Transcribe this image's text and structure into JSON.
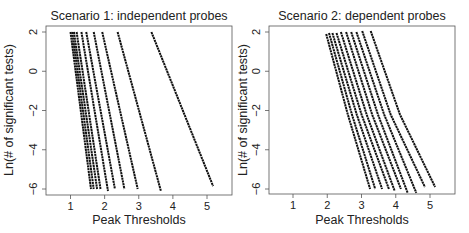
{
  "chart_data": [
    {
      "type": "line",
      "title": "Scenario 1: independent probes",
      "xlabel": "Peak Thresholds",
      "ylabel": "Ln(# of significant tests)",
      "xlim": [
        0.35,
        5.7
      ],
      "ylim": [
        -6.35,
        2.3
      ],
      "xticks": [
        1,
        2,
        3,
        4,
        5
      ],
      "yticks": [
        2,
        0,
        -2,
        -4,
        -6
      ],
      "grid": false,
      "legend": null,
      "series": [
        {
          "name": "curve-1",
          "x": [
            1.0,
            1.6
          ],
          "y": [
            2,
            -6
          ]
        },
        {
          "name": "curve-2",
          "x": [
            1.05,
            1.68
          ],
          "y": [
            2,
            -6
          ]
        },
        {
          "name": "curve-3",
          "x": [
            1.1,
            1.78
          ],
          "y": [
            2,
            -6
          ]
        },
        {
          "name": "curve-4",
          "x": [
            1.18,
            1.88
          ],
          "y": [
            2,
            -6
          ]
        },
        {
          "name": "curve-5",
          "x": [
            1.32,
            2.1
          ],
          "y": [
            2,
            -6.1
          ]
        },
        {
          "name": "curve-6",
          "x": [
            1.46,
            2.3
          ],
          "y": [
            2,
            -6
          ]
        },
        {
          "name": "curve-7",
          "x": [
            1.68,
            2.58
          ],
          "y": [
            2,
            -6
          ]
        },
        {
          "name": "curve-8",
          "x": [
            1.93,
            2.97
          ],
          "y": [
            2,
            -6
          ]
        },
        {
          "name": "curve-9",
          "x": [
            2.38,
            3.65
          ],
          "y": [
            2,
            -6.1
          ]
        },
        {
          "name": "curve-10",
          "x": [
            3.37,
            5.18
          ],
          "y": [
            2,
            -5.85
          ]
        }
      ]
    },
    {
      "type": "line",
      "title": "Scenario 2: dependent probes",
      "xlabel": "Peak Thresholds",
      "ylabel": "Ln(# of significant tests)",
      "xlim": [
        0.35,
        5.7
      ],
      "ylim": [
        -6.35,
        2.3
      ],
      "xticks": [
        1,
        2,
        3,
        4,
        5
      ],
      "yticks": [
        2,
        0,
        -2,
        -4,
        -6
      ],
      "grid": false,
      "legend": null,
      "series": [
        {
          "name": "curve-1",
          "x": [
            1.97,
            2.6,
            3.25
          ],
          "y": [
            1.9,
            -2.2,
            -6
          ]
        },
        {
          "name": "curve-2",
          "x": [
            2.05,
            2.72,
            3.4
          ],
          "y": [
            1.95,
            -2.2,
            -6
          ]
        },
        {
          "name": "curve-3",
          "x": [
            2.15,
            2.86,
            3.6
          ],
          "y": [
            1.95,
            -2.2,
            -6
          ]
        },
        {
          "name": "curve-4",
          "x": [
            2.27,
            3.0,
            3.8
          ],
          "y": [
            1.95,
            -2.2,
            -6
          ]
        },
        {
          "name": "curve-5",
          "x": [
            2.4,
            3.15,
            3.97
          ],
          "y": [
            2,
            -2.2,
            -6.1
          ]
        },
        {
          "name": "curve-6",
          "x": [
            2.55,
            3.31,
            4.15
          ],
          "y": [
            2,
            -2.2,
            -6
          ]
        },
        {
          "name": "curve-7",
          "x": [
            2.7,
            3.48,
            4.35
          ],
          "y": [
            2,
            -2.2,
            -6.2
          ]
        },
        {
          "name": "curve-8",
          "x": [
            2.85,
            3.66,
            4.6
          ],
          "y": [
            2,
            -2.2,
            -6.2
          ]
        },
        {
          "name": "curve-9",
          "x": [
            3.02,
            3.85,
            4.85
          ],
          "y": [
            2.05,
            -2.2,
            -5.9
          ]
        },
        {
          "name": "curve-10",
          "x": [
            3.27,
            4.12,
            5.15
          ],
          "y": [
            2.05,
            -2.2,
            -5.9
          ]
        }
      ]
    }
  ],
  "panels": [
    {
      "title": "Scenario 1: independent probes",
      "xlabel": "Peak Thresholds",
      "ylabel": "Ln(# of significant tests)"
    },
    {
      "title": "Scenario 2: dependent probes",
      "xlabel": "Peak Thresholds",
      "ylabel": "Ln(# of significant tests)"
    }
  ],
  "colors": {
    "line": "#111111",
    "frame": "#555555",
    "text": "#222222"
  }
}
